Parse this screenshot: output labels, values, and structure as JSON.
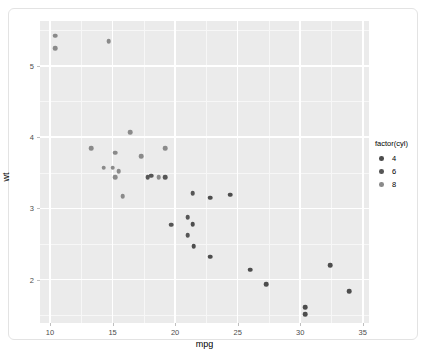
{
  "chart_data": {
    "type": "scatter",
    "title": "",
    "xlabel": "mpg",
    "ylabel": "wt",
    "xlim": [
      9.2,
      35.5
    ],
    "ylim": [
      1.39,
      5.63
    ],
    "xticks": [
      "10",
      "15",
      "20",
      "25",
      "30",
      "35"
    ],
    "xtick_values": [
      10,
      15,
      20,
      25,
      30,
      35
    ],
    "yticks": [
      "2",
      "3",
      "4",
      "5"
    ],
    "ytick_values": [
      2,
      3,
      4,
      5
    ],
    "x_minor_values": [
      12.5,
      17.5,
      22.5,
      27.5,
      32.5
    ],
    "y_minor_values": [
      1.5,
      2.5,
      3.5,
      4.5,
      5.5
    ],
    "grid": true,
    "legend": {
      "title": "factor(cyl)",
      "position": "right",
      "entries": [
        {
          "label": "4",
          "color": "#4d4d4d"
        },
        {
          "label": "6",
          "color": "#565656"
        },
        {
          "label": "8",
          "color": "#8a8a8a"
        }
      ]
    },
    "colors": {
      "panel_background": "#ebebeb",
      "gridline_major": "#ffffff",
      "gridline_minor": "#f7f7f7",
      "point_4": "#4d4d4d",
      "point_6": "#565656",
      "point_8": "#8a8a8a",
      "axis_text": "#4d4d4d",
      "card_border": "#e3e3e3"
    },
    "series": [
      {
        "name": "4",
        "color": "#4d4d4d",
        "points": [
          {
            "x": 22.8,
            "y": 2.32
          },
          {
            "x": 24.4,
            "y": 3.19
          },
          {
            "x": 22.8,
            "y": 3.15
          },
          {
            "x": 32.4,
            "y": 2.2
          },
          {
            "x": 30.4,
            "y": 1.615
          },
          {
            "x": 33.9,
            "y": 1.835
          },
          {
            "x": 21.5,
            "y": 2.465
          },
          {
            "x": 27.3,
            "y": 1.935
          },
          {
            "x": 26.0,
            "y": 2.14
          },
          {
            "x": 30.4,
            "y": 1.513
          },
          {
            "x": 21.4,
            "y": 2.78
          }
        ]
      },
      {
        "name": "6",
        "color": "#565656",
        "points": [
          {
            "x": 21.0,
            "y": 2.62
          },
          {
            "x": 21.0,
            "y": 2.875
          },
          {
            "x": 21.4,
            "y": 3.215
          },
          {
            "x": 18.1,
            "y": 3.46
          },
          {
            "x": 19.2,
            "y": 3.44
          },
          {
            "x": 17.8,
            "y": 3.44
          },
          {
            "x": 19.7,
            "y": 2.77
          }
        ]
      },
      {
        "name": "8",
        "color": "#8a8a8a",
        "points": [
          {
            "x": 18.7,
            "y": 3.44
          },
          {
            "x": 14.3,
            "y": 3.57
          },
          {
            "x": 16.4,
            "y": 4.07
          },
          {
            "x": 17.3,
            "y": 3.73
          },
          {
            "x": 15.2,
            "y": 3.78
          },
          {
            "x": 10.4,
            "y": 5.25
          },
          {
            "x": 10.4,
            "y": 5.424
          },
          {
            "x": 14.7,
            "y": 5.345
          },
          {
            "x": 15.5,
            "y": 3.52
          },
          {
            "x": 15.2,
            "y": 3.435
          },
          {
            "x": 13.3,
            "y": 3.84
          },
          {
            "x": 19.2,
            "y": 3.845
          },
          {
            "x": 15.8,
            "y": 3.17
          },
          {
            "x": 15.0,
            "y": 3.57
          }
        ]
      }
    ]
  }
}
